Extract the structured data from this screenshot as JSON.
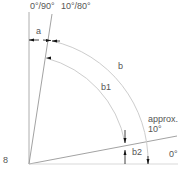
{
  "diagram": {
    "labels": {
      "top_left": "0°/90°",
      "top_right": "10°/80°",
      "a": "a",
      "b": "b",
      "b1": "b1",
      "b2": "b2",
      "approx_line1": "approx.",
      "approx_line2": "10°",
      "zero": "0°",
      "figure_number": "8"
    },
    "colors": {
      "line": "#8a8a8a",
      "arc": "#c8c8c8",
      "arrow": "#111111",
      "text": "#555555"
    }
  }
}
